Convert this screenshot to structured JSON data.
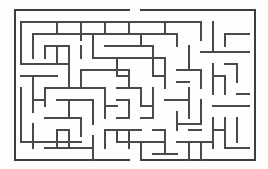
{
  "figure": {
    "kind": "maze-puzzle",
    "width": 268,
    "height": 169,
    "background_color": "#fdfdfd",
    "wall_color": "#4a4a4a",
    "border_color": "#3d3d3d",
    "line_width": 1.05
  },
  "maze": {
    "origin_x": 15,
    "origin_y": 10,
    "cell": 6,
    "cols": 40,
    "rows": 25,
    "entrance": {
      "side": "top",
      "col": 20
    },
    "exit": {
      "side": "bottom",
      "col": 20
    },
    "border_segments": [
      [
        0,
        0,
        19,
        0
      ],
      [
        21,
        0,
        40,
        0
      ],
      [
        40,
        0,
        40,
        25
      ],
      [
        0,
        25,
        19,
        25
      ],
      [
        21,
        25,
        40,
        25
      ],
      [
        0,
        0,
        0,
        25
      ]
    ],
    "wall_segments": [
      [
        1,
        2,
        31,
        2
      ],
      [
        31,
        2,
        31,
        5
      ],
      [
        1,
        2,
        1,
        9
      ],
      [
        1,
        9,
        9,
        9
      ],
      [
        3,
        4,
        27,
        4
      ],
      [
        27,
        4,
        27,
        6
      ],
      [
        3,
        4,
        3,
        8
      ],
      [
        5,
        6,
        5,
        8
      ],
      [
        5,
        6,
        9,
        6
      ],
      [
        7,
        6,
        7,
        9
      ],
      [
        9,
        6,
        9,
        13
      ],
      [
        11,
        2,
        11,
        5
      ],
      [
        13,
        4,
        13,
        8
      ],
      [
        13,
        8,
        25,
        8
      ],
      [
        15,
        6,
        23,
        6
      ],
      [
        23,
        6,
        23,
        11
      ],
      [
        17,
        8,
        17,
        11
      ],
      [
        19,
        10,
        19,
        13
      ],
      [
        11,
        10,
        19,
        10
      ],
      [
        11,
        10,
        11,
        13
      ],
      [
        33,
        2,
        33,
        7
      ],
      [
        33,
        7,
        39,
        7
      ],
      [
        35,
        4,
        39,
        4
      ],
      [
        35,
        4,
        35,
        6
      ],
      [
        29,
        6,
        29,
        10
      ],
      [
        25,
        8,
        25,
        13
      ],
      [
        27,
        10,
        31,
        10
      ],
      [
        31,
        10,
        31,
        13
      ],
      [
        33,
        9,
        33,
        14
      ],
      [
        35,
        9,
        37,
        9
      ],
      [
        37,
        9,
        37,
        12
      ],
      [
        1,
        11,
        7,
        11
      ],
      [
        3,
        11,
        3,
        17
      ],
      [
        5,
        13,
        5,
        16
      ],
      [
        5,
        13,
        15,
        13
      ],
      [
        7,
        15,
        13,
        15
      ],
      [
        13,
        15,
        13,
        19
      ],
      [
        15,
        13,
        15,
        18
      ],
      [
        17,
        13,
        21,
        13
      ],
      [
        21,
        13,
        21,
        16
      ],
      [
        17,
        15,
        19,
        15
      ],
      [
        19,
        15,
        19,
        18
      ],
      [
        23,
        13,
        23,
        18
      ],
      [
        21,
        18,
        23,
        18
      ],
      [
        17,
        18,
        19,
        18
      ],
      [
        25,
        15,
        29,
        15
      ],
      [
        29,
        13,
        29,
        18
      ],
      [
        27,
        17,
        27,
        20
      ],
      [
        31,
        15,
        31,
        19
      ],
      [
        33,
        16,
        39,
        16
      ],
      [
        35,
        18,
        35,
        23
      ],
      [
        37,
        18,
        37,
        22
      ],
      [
        33,
        18,
        33,
        23
      ],
      [
        1,
        13,
        1,
        22
      ],
      [
        1,
        22,
        11,
        22
      ],
      [
        5,
        18,
        11,
        18
      ],
      [
        11,
        18,
        11,
        21
      ],
      [
        7,
        20,
        9,
        20
      ],
      [
        7,
        20,
        7,
        23
      ],
      [
        9,
        20,
        9,
        23
      ],
      [
        3,
        19,
        3,
        23
      ],
      [
        13,
        21,
        13,
        25
      ],
      [
        15,
        20,
        15,
        23
      ],
      [
        15,
        20,
        21,
        20
      ],
      [
        17,
        22,
        25,
        22
      ],
      [
        21,
        22,
        21,
        25
      ],
      [
        19,
        20,
        19,
        23
      ],
      [
        23,
        20,
        25,
        20
      ],
      [
        25,
        20,
        25,
        24
      ],
      [
        27,
        22,
        33,
        22
      ],
      [
        29,
        20,
        31,
        20
      ],
      [
        29,
        22,
        29,
        25
      ],
      [
        31,
        22,
        31,
        25
      ],
      [
        35,
        23,
        39,
        23
      ],
      [
        5,
        9,
        7,
        9
      ],
      [
        11,
        6,
        11,
        8
      ],
      [
        21,
        4,
        21,
        6
      ],
      [
        25,
        2,
        25,
        4
      ],
      [
        19,
        2,
        19,
        4
      ],
      [
        15,
        2,
        15,
        4
      ],
      [
        7,
        2,
        7,
        4
      ],
      [
        33,
        11,
        35,
        11
      ],
      [
        35,
        11,
        35,
        14
      ],
      [
        31,
        7,
        33,
        7
      ],
      [
        27,
        12,
        29,
        12
      ],
      [
        15,
        16,
        17,
        16
      ],
      [
        21,
        16,
        23,
        16
      ],
      [
        9,
        15,
        9,
        18
      ],
      [
        17,
        11,
        19,
        11
      ],
      [
        23,
        11,
        25,
        11
      ],
      [
        3,
        15,
        5,
        15
      ],
      [
        37,
        14,
        39,
        14
      ],
      [
        27,
        19,
        31,
        19
      ],
      [
        23,
        24,
        27,
        24
      ],
      [
        33,
        20,
        35,
        20
      ],
      [
        11,
        13,
        13,
        13
      ],
      [
        5,
        23,
        13,
        23
      ],
      [
        17,
        20,
        17,
        22
      ]
    ]
  }
}
